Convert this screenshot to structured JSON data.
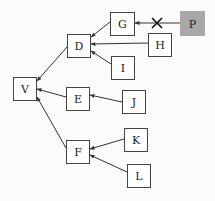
{
  "diagram": {
    "type": "tree",
    "colors": {
      "line": "#333333",
      "box_fill": "#ffffff",
      "box_stroke": "#444444",
      "highlight_fill": "#a8a8a8",
      "background": "#fbfbfb"
    },
    "nodes": [
      {
        "id": "V",
        "label": "V",
        "x": 13,
        "y": 77,
        "w": 23,
        "h": 23,
        "highlight": false
      },
      {
        "id": "D",
        "label": "D",
        "x": 67,
        "y": 34,
        "w": 23,
        "h": 23,
        "highlight": false
      },
      {
        "id": "E",
        "label": "E",
        "x": 66,
        "y": 87,
        "w": 23,
        "h": 23,
        "highlight": false
      },
      {
        "id": "F",
        "label": "F",
        "x": 66,
        "y": 140,
        "w": 23,
        "h": 23,
        "highlight": false
      },
      {
        "id": "G",
        "label": "G",
        "x": 110,
        "y": 12,
        "w": 24,
        "h": 23,
        "highlight": false
      },
      {
        "id": "H",
        "label": "H",
        "x": 148,
        "y": 33,
        "w": 23,
        "h": 23,
        "highlight": false
      },
      {
        "id": "I",
        "label": "I",
        "x": 111,
        "y": 56,
        "w": 23,
        "h": 23,
        "highlight": false
      },
      {
        "id": "J",
        "label": "J",
        "x": 122,
        "y": 90,
        "w": 23,
        "h": 23,
        "highlight": false
      },
      {
        "id": "K",
        "label": "K",
        "x": 124,
        "y": 128,
        "w": 23,
        "h": 23,
        "highlight": false
      },
      {
        "id": "L",
        "label": "L",
        "x": 127,
        "y": 164,
        "w": 23,
        "h": 23,
        "highlight": false
      },
      {
        "id": "P",
        "label": "P",
        "x": 180,
        "y": 11,
        "w": 24,
        "h": 24,
        "highlight": true
      }
    ],
    "edges": [
      {
        "from": "D",
        "to": "V",
        "x1": 67,
        "y1": 47,
        "x2": 37,
        "y2": 81,
        "blocked": false
      },
      {
        "from": "E",
        "to": "V",
        "x1": 66,
        "y1": 97,
        "x2": 37,
        "y2": 89,
        "blocked": false
      },
      {
        "from": "F",
        "to": "V",
        "x1": 66,
        "y1": 148,
        "x2": 37,
        "y2": 97,
        "blocked": false
      },
      {
        "from": "G",
        "to": "D",
        "x1": 110,
        "y1": 22,
        "x2": 91,
        "y2": 37,
        "blocked": false
      },
      {
        "from": "H",
        "to": "D",
        "x1": 148,
        "y1": 43,
        "x2": 91,
        "y2": 44,
        "blocked": false
      },
      {
        "from": "I",
        "to": "D",
        "x1": 111,
        "y1": 64,
        "x2": 91,
        "y2": 51,
        "blocked": false
      },
      {
        "from": "J",
        "to": "E",
        "x1": 122,
        "y1": 102,
        "x2": 90,
        "y2": 95,
        "blocked": false
      },
      {
        "from": "K",
        "to": "F",
        "x1": 124,
        "y1": 139,
        "x2": 90,
        "y2": 149,
        "blocked": false
      },
      {
        "from": "L",
        "to": "F",
        "x1": 127,
        "y1": 172,
        "x2": 90,
        "y2": 155,
        "blocked": false
      },
      {
        "from": "P",
        "to": "G",
        "x1": 180,
        "y1": 23,
        "x2": 135,
        "y2": 23,
        "blocked": true,
        "cross_x": 157,
        "cross_y": 23
      }
    ]
  }
}
